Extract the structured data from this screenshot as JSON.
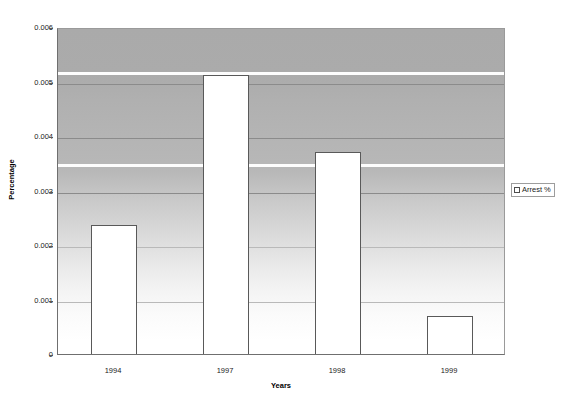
{
  "chart_data": {
    "type": "bar",
    "title": "",
    "xlabel": "Years",
    "ylabel": "Percentage",
    "categories": [
      "1994",
      "1997",
      "1998",
      "1999"
    ],
    "series": [
      {
        "name": "Arrest %",
        "values": [
          0.0024,
          0.00515,
          0.00375,
          0.00073
        ]
      }
    ],
    "ylim": [
      0,
      0.006
    ],
    "yticks": [
      "0",
      "0.001",
      "0.002",
      "0.003",
      "0.004",
      "0.005",
      "0.006"
    ],
    "ytick_values": [
      0,
      0.001,
      0.002,
      0.003,
      0.004,
      0.005,
      0.006
    ],
    "grid": true,
    "legend": {
      "position": "right",
      "entries": [
        {
          "label": "Arrest %",
          "swatch_color": "#ffffff",
          "swatch_border": "#4d4d4d"
        }
      ]
    },
    "style": {
      "bar_fill": "#ffffff",
      "bar_border": "#595959",
      "plot_bg_top": "#aaaaaa",
      "plot_bg_bottom": "#ffffff",
      "gridline_color": "#8b8b8b",
      "highlight_band_color": "#fdfdfd",
      "axis_color": "#6f6f6f"
    },
    "highlight_bands": [
      0.0052,
      0.0035
    ]
  }
}
